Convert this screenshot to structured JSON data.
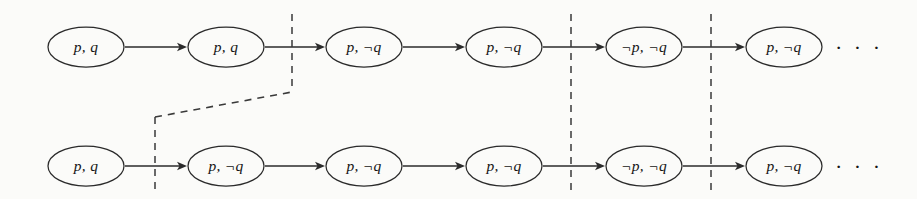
{
  "figure": {
    "background_color": "#fbfbf9",
    "stroke_color": "#2b2b2b",
    "dash_color": "#3a3a3a",
    "width": 917,
    "height": 199
  },
  "rows": [
    {
      "id": "top-row",
      "center_y": 47,
      "nodes": [
        {
          "label": "p, q",
          "cx": 86,
          "cy": 47
        },
        {
          "label": "p, q",
          "cx": 226,
          "cy": 47
        },
        {
          "label": "p, ¬q",
          "cx": 364,
          "cy": 47
        },
        {
          "label": "p, ¬q",
          "cx": 504,
          "cy": 47
        },
        {
          "label": "¬p, ¬q",
          "cx": 644,
          "cy": 47
        },
        {
          "label": "p, ¬q",
          "cx": 784,
          "cy": 47
        }
      ],
      "ellipsis": {
        "label": "· · ·",
        "cx": 859,
        "cy": 50
      }
    },
    {
      "id": "bottom-row",
      "center_y": 166,
      "nodes": [
        {
          "label": "p, q",
          "cx": 86,
          "cy": 166
        },
        {
          "label": "p, ¬q",
          "cx": 226,
          "cy": 166
        },
        {
          "label": "p, ¬q",
          "cx": 364,
          "cy": 166
        },
        {
          "label": "p, ¬q",
          "cx": 504,
          "cy": 166
        },
        {
          "label": "¬p, ¬q",
          "cx": 644,
          "cy": 166
        },
        {
          "label": "p, ¬q",
          "cx": 784,
          "cy": 166
        }
      ],
      "ellipsis": {
        "label": "· · ·",
        "cx": 859,
        "cy": 169
      }
    }
  ],
  "cut_lines": [
    {
      "id": "cut-top-1",
      "x": 292,
      "y1": 14,
      "y2": 92
    },
    {
      "id": "cut-full-1",
      "x": 571,
      "y1": 14,
      "y2": 191
    },
    {
      "id": "cut-full-2",
      "x": 711,
      "y1": 14,
      "y2": 191
    },
    {
      "id": "cut-bottom-1",
      "x": 155,
      "y1": 117,
      "y2": 192
    }
  ],
  "connector": {
    "id": "row-link",
    "x1": 155,
    "y1": 117,
    "x2": 292,
    "y2": 92
  },
  "node_geometry": {
    "rx": 38,
    "ry": 20
  }
}
